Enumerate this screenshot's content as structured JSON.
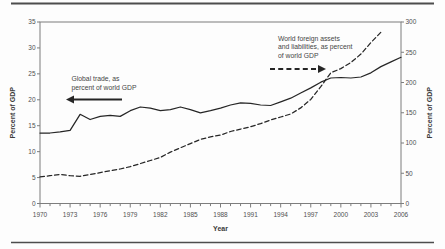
{
  "figure": {
    "xlabel": "Year",
    "ylabel_left": "Percent of GDP",
    "ylabel_right": "Percent of GDP"
  },
  "colors": {
    "series_line": "#262626",
    "axis": "#7d7d7d",
    "tick_text": "#4f4f4f",
    "annotation_text": "#454545",
    "rule": "#4d4d4d",
    "background": "#fdfdfd"
  },
  "chart_data": {
    "type": "line",
    "title": "",
    "xlabel": "Year",
    "ylabel_left": "Percent of GDP",
    "ylabel_right": "Percent of GDP",
    "xlim": [
      1970,
      2006
    ],
    "x_tick_labels": [
      1970,
      1973,
      1976,
      1979,
      1982,
      1985,
      1988,
      1991,
      1994,
      1997,
      2000,
      2003,
      2006
    ],
    "x_minor_tick_every": 1,
    "ylim_left": [
      0,
      35
    ],
    "yticks_left": [
      0,
      5,
      10,
      15,
      20,
      25,
      30,
      35
    ],
    "ylim_right": [
      0,
      300
    ],
    "yticks_right": [
      0,
      50,
      100,
      150,
      200,
      250,
      300
    ],
    "grid": false,
    "legend": "annotations-with-arrows",
    "series": [
      {
        "name": "Global trade, as percent of world GDP",
        "axis": "left",
        "style": "solid",
        "years": [
          1970,
          1971,
          1972,
          1973,
          1974,
          1975,
          1976,
          1977,
          1978,
          1979,
          1980,
          1981,
          1982,
          1983,
          1984,
          1985,
          1986,
          1987,
          1988,
          1989,
          1990,
          1991,
          1992,
          1993,
          1994,
          1995,
          1996,
          1997,
          1998,
          1999,
          2000,
          2001,
          2002,
          2003,
          2004,
          2005,
          2006
        ],
        "values": [
          13.6,
          13.6,
          13.8,
          14.1,
          17.2,
          16.2,
          16.8,
          17.0,
          16.8,
          17.9,
          18.6,
          18.4,
          17.9,
          18.1,
          18.6,
          18.1,
          17.5,
          17.9,
          18.4,
          19.0,
          19.4,
          19.3,
          19.0,
          18.9,
          19.6,
          20.3,
          21.3,
          22.3,
          23.4,
          24.2,
          24.3,
          24.2,
          24.4,
          25.2,
          26.4,
          27.3,
          28.2
        ]
      },
      {
        "name": "World foreign assets and liabilities, as percent of world GDP",
        "axis": "right",
        "style": "dashed",
        "years": [
          1970,
          1971,
          1972,
          1973,
          1974,
          1975,
          1976,
          1977,
          1978,
          1979,
          1980,
          1981,
          1982,
          1983,
          1984,
          1985,
          1986,
          1987,
          1988,
          1989,
          1990,
          1991,
          1992,
          1993,
          1994,
          1995,
          1996,
          1997,
          1998,
          1999,
          2000,
          2001,
          2002,
          2003,
          2004
        ],
        "values": [
          44,
          46,
          48,
          46,
          45,
          48,
          51,
          54,
          57,
          61,
          66,
          71,
          76,
          85,
          92,
          99,
          106,
          110,
          113,
          119,
          123,
          127,
          132,
          138,
          143,
          148,
          158,
          172,
          193,
          216,
          223,
          233,
          247,
          266,
          283
        ]
      }
    ],
    "annotations": [
      {
        "id": "global-trade-label",
        "lines": [
          "Global trade, as",
          "percent of world GDP"
        ],
        "text_x": 71.5,
        "first_baseline_y": 81,
        "line_height": 8.6,
        "arrow": {
          "style": "solid",
          "direction": "left",
          "x_tail": 122,
          "x_head": 66,
          "y": 99.5
        }
      },
      {
        "id": "foreign-assets-label",
        "lines": [
          "World foreign assets",
          "and liabilities, as percent",
          "of world GDP"
        ],
        "text_x": 278,
        "first_baseline_y": 40.5,
        "line_height": 8.6,
        "arrow": {
          "style": "dashed",
          "direction": "right",
          "x_tail": 270,
          "x_head": 326,
          "y": 69
        }
      }
    ]
  }
}
